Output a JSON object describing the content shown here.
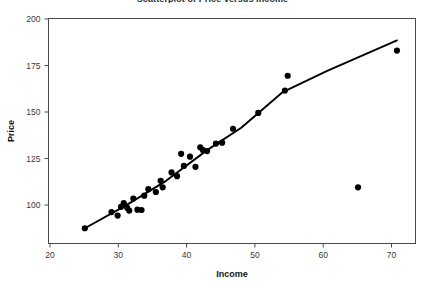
{
  "chart_data": {
    "type": "scatter",
    "title": "Scatterplot of Price versus Income",
    "xlabel": "Income",
    "ylabel": "Price",
    "xlim": [
      20,
      73
    ],
    "ylim": [
      83,
      202
    ],
    "xticks": [
      20,
      30,
      40,
      50,
      60,
      70
    ],
    "yticks": [
      100,
      125,
      150,
      175,
      200
    ],
    "grid": false,
    "legend": "none",
    "marker": "filled-circle",
    "marker_color": "#000000",
    "x": [
      25.1,
      29.0,
      29.9,
      30.4,
      30.8,
      31.3,
      31.6,
      32.2,
      32.8,
      33.4,
      33.8,
      34.4,
      35.5,
      36.2,
      36.5,
      37.8,
      38.6,
      39.2,
      39.6,
      40.5,
      41.3,
      42.0,
      42.4,
      43.0,
      44.3,
      45.2,
      46.8,
      50.5,
      54.4,
      54.8,
      65.1,
      70.8
    ],
    "y": [
      87.5,
      96.2,
      94.3,
      99.0,
      101.0,
      98.5,
      97.0,
      103.5,
      97.5,
      97.3,
      105.0,
      108.5,
      107.0,
      113.0,
      109.5,
      117.5,
      115.5,
      127.5,
      121.0,
      126.0,
      120.5,
      131.0,
      129.5,
      129.0,
      133.0,
      133.5,
      141.0,
      149.5,
      161.5,
      169.5,
      109.5,
      183.0
    ],
    "fit_line": {
      "name": "lowess-fit",
      "x": [
        25.1,
        31.0,
        37.0,
        43.0,
        48.0,
        54.0,
        60.5,
        70.8
      ],
      "y": [
        87.5,
        99.5,
        113.0,
        129.5,
        141.5,
        160.5,
        172.0,
        188.5
      ]
    },
    "series": [
      {
        "name": "Price",
        "points": [
          {
            "x": 25.1,
            "y": 87.5
          },
          {
            "x": 29.0,
            "y": 96.2
          },
          {
            "x": 29.9,
            "y": 94.3
          },
          {
            "x": 30.4,
            "y": 99.0
          },
          {
            "x": 30.8,
            "y": 101.0
          },
          {
            "x": 31.3,
            "y": 98.5
          },
          {
            "x": 31.6,
            "y": 97.0
          },
          {
            "x": 32.2,
            "y": 103.5
          },
          {
            "x": 32.8,
            "y": 97.5
          },
          {
            "x": 33.4,
            "y": 97.3
          },
          {
            "x": 33.8,
            "y": 105.0
          },
          {
            "x": 34.4,
            "y": 108.5
          },
          {
            "x": 35.5,
            "y": 107.0
          },
          {
            "x": 36.2,
            "y": 113.0
          },
          {
            "x": 36.5,
            "y": 109.5
          },
          {
            "x": 37.8,
            "y": 117.5
          },
          {
            "x": 38.6,
            "y": 115.5
          },
          {
            "x": 39.2,
            "y": 127.5
          },
          {
            "x": 39.6,
            "y": 121.0
          },
          {
            "x": 40.5,
            "y": 126.0
          },
          {
            "x": 41.3,
            "y": 120.5
          },
          {
            "x": 42.0,
            "y": 131.0
          },
          {
            "x": 42.4,
            "y": 129.5
          },
          {
            "x": 43.0,
            "y": 129.0
          },
          {
            "x": 44.3,
            "y": 133.0
          },
          {
            "x": 45.2,
            "y": 133.5
          },
          {
            "x": 46.8,
            "y": 141.0
          },
          {
            "x": 50.5,
            "y": 149.5
          },
          {
            "x": 54.4,
            "y": 161.5
          },
          {
            "x": 54.8,
            "y": 169.5
          },
          {
            "x": 65.1,
            "y": 109.5
          },
          {
            "x": 70.8,
            "y": 183.0
          }
        ]
      }
    ]
  }
}
